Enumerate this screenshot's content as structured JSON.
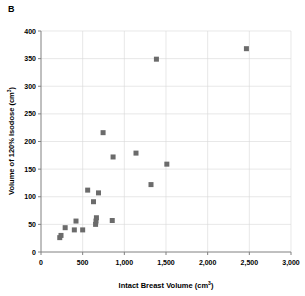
{
  "panel": {
    "label": "B"
  },
  "chart_data": {
    "type": "scatter",
    "title": "",
    "xlabel": "Intact Breast Volume (cm3)",
    "xlabel_base": "Intact Breast Volume (cm",
    "xlabel_sup": "3",
    "xlabel_tail": ")",
    "ylabel": "Volume of 120% Isodose (cm3)",
    "ylabel_base": "Volume of 120% Isodose (cm",
    "ylabel_sup": "3",
    "ylabel_tail": ")",
    "xlim": [
      0,
      3000
    ],
    "ylim": [
      0,
      400
    ],
    "xticks": [
      0,
      500,
      1000,
      1500,
      2000,
      2500,
      3000
    ],
    "xticklabels": [
      "0",
      "500",
      "1,000",
      "1,500",
      "2,000",
      "2,500",
      "3,000"
    ],
    "yticks": [
      0,
      50,
      100,
      150,
      200,
      250,
      300,
      350,
      400
    ],
    "yticklabels": [
      "0",
      "50",
      "100",
      "150",
      "200",
      "250",
      "300",
      "350",
      "400"
    ],
    "grid": true,
    "grid_axis": "both",
    "legend": false,
    "marker_color": "#6b6b6b",
    "marker_shape": "square",
    "marker_size": 5,
    "series": [
      {
        "name": "Patients",
        "points": [
          {
            "x": 225,
            "y": 26
          },
          {
            "x": 240,
            "y": 30
          },
          {
            "x": 290,
            "y": 44
          },
          {
            "x": 400,
            "y": 40
          },
          {
            "x": 420,
            "y": 56
          },
          {
            "x": 500,
            "y": 40
          },
          {
            "x": 560,
            "y": 112
          },
          {
            "x": 630,
            "y": 91
          },
          {
            "x": 655,
            "y": 50
          },
          {
            "x": 660,
            "y": 56
          },
          {
            "x": 665,
            "y": 62
          },
          {
            "x": 690,
            "y": 107
          },
          {
            "x": 745,
            "y": 216
          },
          {
            "x": 855,
            "y": 57
          },
          {
            "x": 865,
            "y": 172
          },
          {
            "x": 1140,
            "y": 179
          },
          {
            "x": 1320,
            "y": 122
          },
          {
            "x": 1385,
            "y": 349
          },
          {
            "x": 1510,
            "y": 159
          },
          {
            "x": 2465,
            "y": 368
          }
        ]
      }
    ]
  }
}
